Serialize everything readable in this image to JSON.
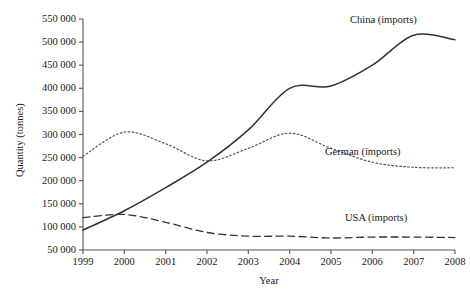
{
  "chart_data": {
    "type": "line",
    "title": "",
    "xlabel": "Year",
    "ylabel": "Quantity (tonnes)",
    "x": [
      1999,
      2000,
      2001,
      2002,
      2003,
      2004,
      2005,
      2006,
      2007,
      2008
    ],
    "xlim": [
      1999,
      2008
    ],
    "ylim": [
      50000,
      550000
    ],
    "xtick_labels": [
      "1999",
      "2000",
      "2001",
      "2002",
      "2003",
      "2004",
      "2005",
      "2006",
      "2007",
      "2008"
    ],
    "ytick_labels": [
      "50 000",
      "100 000",
      "150 000",
      "200 000",
      "250 000",
      "300 000",
      "350 000",
      "400 000",
      "450 000",
      "500 000",
      "550 000"
    ],
    "yticks": [
      50000,
      100000,
      150000,
      200000,
      250000,
      300000,
      350000,
      400000,
      450000,
      500000,
      550000
    ],
    "grid": false,
    "legend_position": "inline-right-of-series",
    "series": [
      {
        "name": "China (imports)",
        "style": "solid",
        "color": "#333333",
        "values": [
          93000,
          135000,
          185000,
          240000,
          310000,
          400000,
          405000,
          450000,
          515000,
          505000
        ],
        "label_text": "China (imports)"
      },
      {
        "name": "German (imports)",
        "style": "dotted",
        "color": "#555555",
        "values": [
          253000,
          305000,
          280000,
          243000,
          270000,
          303000,
          270000,
          240000,
          229000,
          228000
        ],
        "label_text": "German (imports)"
      },
      {
        "name": "USA (imports)",
        "style": "dashed",
        "color": "#333333",
        "values": [
          120000,
          127000,
          110000,
          88000,
          80000,
          80000,
          76000,
          78000,
          78000,
          77000
        ],
        "label_text": "USA (imports)"
      }
    ]
  },
  "axis": {
    "y_axis_label": "Quantity (tonnes)",
    "x_axis_label": "Year"
  },
  "caption": ""
}
